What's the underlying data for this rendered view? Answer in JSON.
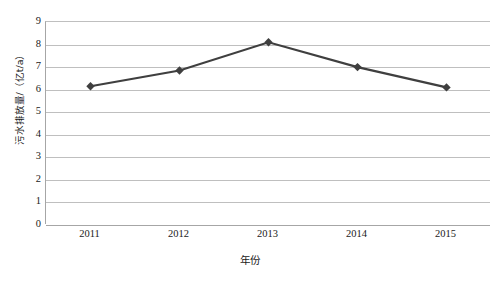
{
  "chart_data": {
    "type": "line",
    "title": "",
    "categories": [
      "2011",
      "2012",
      "2013",
      "2014",
      "2015"
    ],
    "series": [
      {
        "name": "污水排放量",
        "values": [
          6.15,
          6.85,
          8.1,
          7.0,
          6.1
        ]
      }
    ],
    "xlabel": "年份",
    "ylabel": "污水排放量/（亿t/a）",
    "ylim": [
      0,
      9
    ],
    "y_ticks": [
      "9",
      "8",
      "7",
      "6",
      "5",
      "4",
      "3",
      "2",
      "1",
      "0"
    ],
    "y_tick_values": [
      9,
      8,
      7,
      6,
      5,
      4,
      3,
      2,
      1,
      0
    ],
    "x_ticks": [
      "2011",
      "2012",
      "2013",
      "2014",
      "2015"
    ],
    "grid": true,
    "legend": "none",
    "marker": "diamond",
    "colors": {
      "series_line": "#3f3f3f",
      "marker": "#3f3f3f",
      "gridline": "#bfbfbf",
      "axis": "#a6a6a6",
      "background": "#ffffff",
      "text": "#1a1a1a"
    }
  }
}
